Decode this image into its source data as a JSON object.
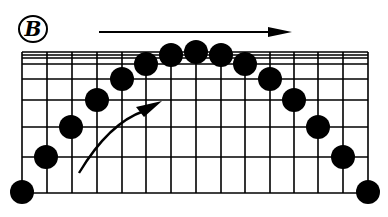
{
  "diagram": {
    "label": "B",
    "colors": {
      "ink": "#000000",
      "background": "#ffffff"
    },
    "grid": {
      "x_lines": [
        22,
        47,
        72,
        97,
        122,
        146,
        171,
        196,
        221,
        245,
        270,
        294,
        318,
        343,
        368
      ],
      "y_lines": [
        52,
        55,
        58,
        64,
        79,
        100,
        127,
        157,
        193
      ],
      "top": 52,
      "bottom": 193,
      "left": 22,
      "right": 368
    },
    "dots": [
      {
        "x": 22,
        "y": 192
      },
      {
        "x": 46,
        "y": 157
      },
      {
        "x": 71,
        "y": 127
      },
      {
        "x": 97,
        "y": 100
      },
      {
        "x": 122,
        "y": 79
      },
      {
        "x": 146,
        "y": 64
      },
      {
        "x": 171,
        "y": 55
      },
      {
        "x": 196,
        "y": 52
      },
      {
        "x": 221,
        "y": 55
      },
      {
        "x": 245,
        "y": 64
      },
      {
        "x": 270,
        "y": 79
      },
      {
        "x": 294,
        "y": 100
      },
      {
        "x": 318,
        "y": 127
      },
      {
        "x": 343,
        "y": 157
      },
      {
        "x": 368,
        "y": 192
      }
    ],
    "dot_radius": 12,
    "arrows": {
      "top": {
        "x1": 99,
        "y1": 32,
        "x2": 292,
        "y2": 32,
        "direction": "right"
      },
      "curved": {
        "start_x": 79,
        "start_y": 173,
        "end_x": 162,
        "end_y": 101,
        "direction": "up-right"
      }
    }
  }
}
